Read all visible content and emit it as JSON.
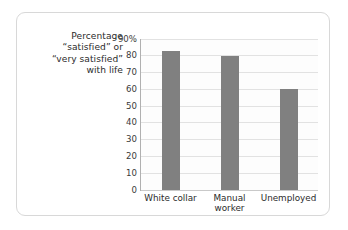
{
  "chart_data": {
    "type": "bar",
    "title": "",
    "subtitle": "",
    "xlabel": "",
    "ylabel": "Percentage “satisfied” or “very satisfied” with life",
    "ylabel_lines": [
      "Percentage",
      "“satisfied” or",
      "“very satisfied”",
      "with life"
    ],
    "categories": [
      "White collar",
      "Manual worker",
      "Unemployed"
    ],
    "category_label_lines": [
      [
        "White collar"
      ],
      [
        "Manual",
        "worker"
      ],
      [
        "Unemployed"
      ]
    ],
    "values": [
      83,
      80,
      60
    ],
    "ylim": [
      0,
      90
    ],
    "yticks": [
      0,
      10,
      20,
      30,
      40,
      50,
      60,
      70,
      80,
      90
    ],
    "ytick_labels": [
      "0",
      "10",
      "20",
      "30",
      "40",
      "50",
      "60",
      "70",
      "80",
      "90%"
    ],
    "grid": true,
    "grid_axis": "y",
    "legend": false,
    "legend_position": "none",
    "bar_color": "#808080",
    "gridline_color": "#e2e2e2",
    "axis_color": "#b0b0b0",
    "plot_background": "#fdfdfd",
    "border_color": "#d8d8d8"
  }
}
